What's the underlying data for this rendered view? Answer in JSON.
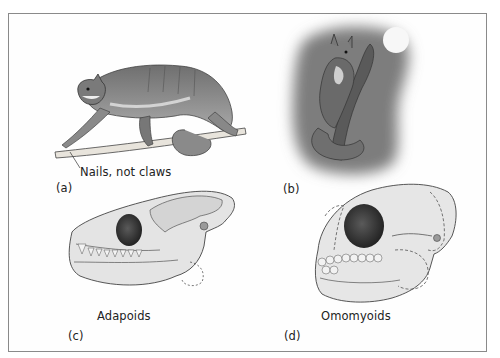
{
  "figure": {
    "panels": [
      {
        "id": "a",
        "letter": "(a)",
        "subject": "primate-on-branch",
        "annotation": "Nails, not claws"
      },
      {
        "id": "b",
        "letter": "(b)",
        "subject": "primate-in-tree-at-night"
      },
      {
        "id": "c",
        "letter": "(c)",
        "subject": "skull",
        "caption": "Adapoids"
      },
      {
        "id": "d",
        "letter": "(d)",
        "subject": "skull",
        "caption": "Omomyoids"
      }
    ],
    "colors": {
      "frame": "#8a8a8a",
      "night_background": "#7d7d7d",
      "moon": "#f7f7f7",
      "fur": "#8f8f8f",
      "bone": "#e6e6e6",
      "orbit": "#3a3a3a"
    }
  }
}
